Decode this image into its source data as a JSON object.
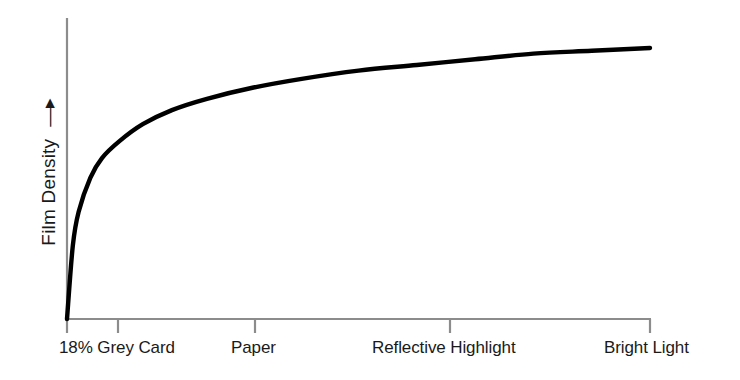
{
  "chart_data": {
    "type": "line",
    "title": "",
    "xlabel": "",
    "ylabel": "Film Density",
    "ylabel_arrow": "→",
    "grid": false,
    "legend": null,
    "xlim": [
      0,
      100
    ],
    "ylim": [
      0,
      100
    ],
    "axis_color": "#8c8c8c",
    "curve_color": "#000000",
    "text_color": "#1a1a1a",
    "background": "#ffffff",
    "categories": [
      "18% Grey Card",
      "Paper",
      "Reflective Highlight",
      "Bright Light"
    ],
    "tick_labels": [
      "18% Grey Card",
      "Paper",
      "Reflective Highlight",
      "Bright Light"
    ],
    "tick_x_positions": [
      0,
      8.8,
      32.3,
      65.7,
      100
    ],
    "series": [
      {
        "name": "Film characteristic curve",
        "x": [
          0,
          1,
          2,
          4,
          6,
          9,
          13,
          18,
          24,
          32,
          40,
          50,
          60,
          70,
          80,
          90,
          100
        ],
        "values": [
          0,
          26,
          38,
          50,
          57,
          63,
          69,
          74,
          78,
          82,
          85,
          88,
          90,
          92,
          94,
          95,
          96
        ]
      }
    ],
    "annotations": []
  },
  "labels": {
    "x0": "18% Grey Card",
    "x1": "Paper",
    "x2": "Reflective Highlight",
    "x3": "Bright Light",
    "y_axis": "Film Density",
    "arrow": "→"
  }
}
